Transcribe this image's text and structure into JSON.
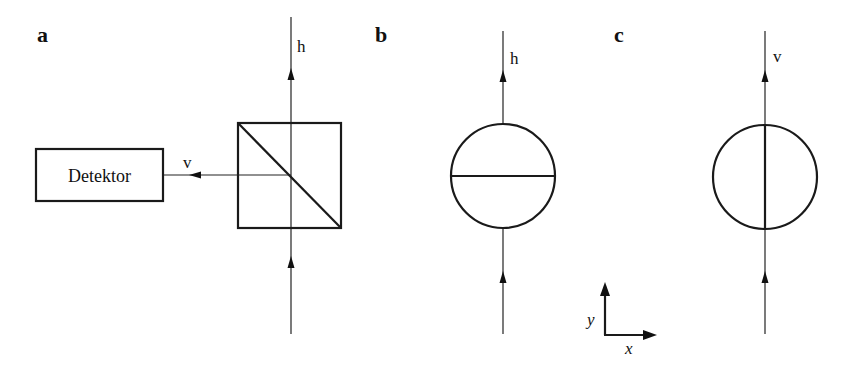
{
  "panels": {
    "a": {
      "label": "a",
      "beam_out_label": "h",
      "reflected_label": "v",
      "detector_label": "Detektor"
    },
    "b": {
      "label": "b",
      "beam_out_label": "h"
    },
    "c": {
      "label": "c",
      "beam_out_label": "v"
    }
  },
  "axes": {
    "x_label": "x",
    "y_label": "y"
  },
  "colors": {
    "line": "#1a1a1a",
    "background": "#ffffff"
  }
}
